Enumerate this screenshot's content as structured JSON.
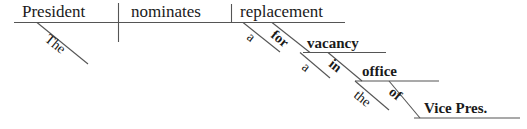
{
  "diagram": {
    "kind": "reed-kellogg-sentence-diagram",
    "sentence": "The President nominates a replacement for a vacancy in the office of Vice Pres.",
    "line_color": "#555555",
    "text_color": "#1a1a1a",
    "background": "#ffffff",
    "main_clause": {
      "subject": "President",
      "verb": "nominates",
      "direct_object": "replacement"
    },
    "modifiers": {
      "subject_article": "The",
      "object_article": "a"
    },
    "prepositional_phrases": [
      {
        "preposition": "for",
        "object": "vacancy",
        "object_article": "a",
        "attaches_to": "replacement"
      },
      {
        "preposition": "in",
        "object": "office",
        "object_article": "the",
        "attaches_to": "vacancy"
      },
      {
        "preposition": "of",
        "object": "Vice Pres.",
        "object_article": "",
        "attaches_to": "office"
      }
    ],
    "words": {
      "the_subject": "The",
      "president": "President",
      "nominates": "nominates",
      "a_object": "a",
      "replacement": "replacement",
      "for": "for",
      "a_vacancy": "a",
      "vacancy": "vacancy",
      "in": "in",
      "the_office": "the",
      "office": "office",
      "of": "of",
      "vice_pres": "Vice Pres."
    }
  }
}
